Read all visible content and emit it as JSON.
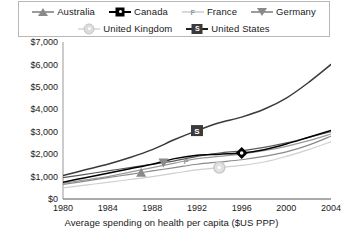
{
  "legend": {
    "rows": [
      [
        {
          "label": "Australia",
          "marker": "triangle-up-marker",
          "color": "#8a8a8a"
        },
        {
          "label": "Canada",
          "marker": "diamond-marker",
          "color": "#000000"
        },
        {
          "label": "France",
          "marker": "letter-f-marker",
          "color": "#9a9a9a"
        },
        {
          "label": "Germany",
          "marker": "triangle-down-marker",
          "color": "#8a8a8a"
        }
      ],
      [
        {
          "label": "United Kingdom",
          "marker": "circle-marker",
          "color": "#d2d2d2"
        },
        {
          "label": "United States",
          "marker": "square-s-marker",
          "color": "#3a3a3a"
        }
      ]
    ]
  },
  "axis": {
    "x_title": "Average spending on health per capita ($US PPP)",
    "y_ticks": [
      "$0",
      "$1,000",
      "$2,000",
      "$3,000",
      "$4,000",
      "$5,000",
      "$6,000",
      "$7,000"
    ],
    "x_ticks": [
      "1980",
      "1984",
      "1988",
      "1992",
      "1996",
      "2000",
      "2004"
    ]
  },
  "chart_data": {
    "type": "line",
    "title": "",
    "xlabel": "Average spending on health per capita ($US PPP)",
    "ylabel": "",
    "xlim": [
      1980,
      2004
    ],
    "ylim": [
      0,
      7000
    ],
    "ytick_values": [
      0,
      1000,
      2000,
      3000,
      4000,
      5000,
      6000,
      7000
    ],
    "xtick_values": [
      1980,
      1984,
      1988,
      1992,
      1996,
      2000,
      2004
    ],
    "grid": false,
    "legend_position": "top",
    "x": [
      1980,
      1982,
      1984,
      1986,
      1988,
      1990,
      1992,
      1994,
      1996,
      1998,
      2000,
      2002,
      2004
    ],
    "series": [
      {
        "name": "United States",
        "marker": "square-s-marker",
        "color": "#3a3a3a",
        "marker_at_x": 1992,
        "values": [
          1050,
          1300,
          1550,
          1850,
          2200,
          2650,
          3050,
          3400,
          3650,
          4000,
          4500,
          5200,
          6000
        ]
      },
      {
        "name": "Canada",
        "marker": "diamond-marker",
        "color": "#000000",
        "marker_at_x": 1996,
        "values": [
          750,
          950,
          1150,
          1350,
          1550,
          1800,
          1950,
          2000,
          2050,
          2200,
          2450,
          2750,
          3050
        ]
      },
      {
        "name": "Germany",
        "marker": "triangle-down-marker",
        "color": "#5a5a5a",
        "marker_at_x": 1989,
        "values": [
          950,
          1100,
          1250,
          1400,
          1550,
          1700,
          1900,
          2050,
          2150,
          2300,
          2500,
          2750,
          3000
        ]
      },
      {
        "name": "France",
        "marker": "letter-f-marker",
        "color": "#9a9a9a",
        "marker_at_x": 1991,
        "values": [
          700,
          850,
          1000,
          1200,
          1400,
          1600,
          1800,
          1900,
          2000,
          2150,
          2350,
          2600,
          2900
        ]
      },
      {
        "name": "Australia",
        "marker": "triangle-up-marker",
        "color": "#8a8a8a",
        "marker_at_x": 1987,
        "values": [
          650,
          800,
          950,
          1100,
          1250,
          1400,
          1550,
          1650,
          1750,
          1900,
          2100,
          2400,
          2800
        ]
      },
      {
        "name": "United Kingdom",
        "marker": "circle-marker",
        "color": "#cfcfcf",
        "marker_at_x": 1994,
        "values": [
          500,
          620,
          740,
          870,
          1000,
          1150,
          1300,
          1400,
          1500,
          1650,
          1900,
          2200,
          2550
        ]
      }
    ]
  }
}
